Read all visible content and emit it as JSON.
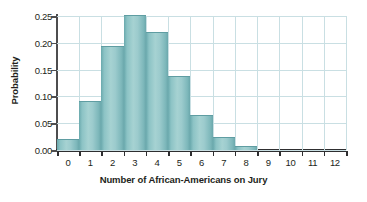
{
  "chart_data": {
    "type": "bar",
    "title": "",
    "xlabel": "Number of African-Americans on Jury",
    "ylabel": "Probability",
    "categories": [
      "0",
      "1",
      "2",
      "3",
      "4",
      "5",
      "6",
      "7",
      "8",
      "9",
      "10",
      "11",
      "12"
    ],
    "values": [
      0.019,
      0.09,
      0.192,
      0.25,
      0.219,
      0.137,
      0.063,
      0.022,
      0.005,
      0.0,
      0.0,
      0.0,
      0.0
    ],
    "ylim": [
      0.0,
      0.25
    ],
    "xlim": [
      -0.5,
      12.5
    ],
    "ytick_labels": [
      "0.00",
      "0.05",
      "0.10",
      "0.15",
      "0.20",
      "0.25"
    ],
    "ytick_values": [
      0.0,
      0.05,
      0.1,
      0.15,
      0.2,
      0.25
    ],
    "grid": "both",
    "legend": "none",
    "bar_color": "#9ccbcd",
    "bar_edge_color": "#5f9da2",
    "grid_color": "#c9dfe3",
    "axis_color": "#2e2e30",
    "text_color": "#231f20",
    "background": "#ffffff"
  }
}
